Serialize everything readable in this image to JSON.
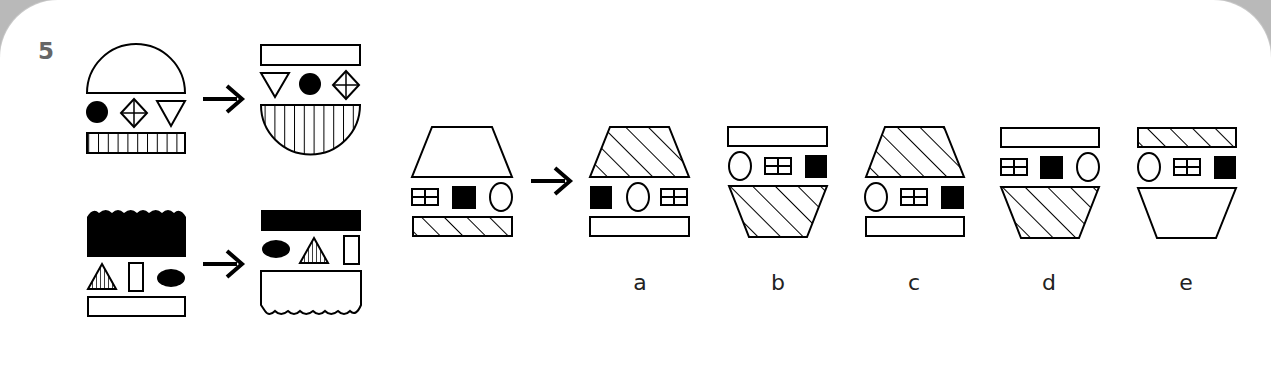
{
  "question": {
    "number": "5"
  },
  "examples": [
    {
      "before": [
        "semicircle (top, white)",
        "black circle",
        "diamond with cross",
        "down triangle",
        "vertical-striped bar"
      ],
      "after": [
        "white bar",
        "down triangle",
        "black circle",
        "diamond with cross",
        "vertical-striped inverted semicircle"
      ]
    },
    {
      "before": [
        "wavy-top black block",
        "striped triangle",
        "white tall rectangle",
        "black ellipse",
        "white bar"
      ],
      "after": [
        "black bar",
        "black ellipse",
        "striped triangle",
        "white tall rectangle",
        "wavy-bottom white block"
      ]
    }
  ],
  "test": {
    "figure": [
      "white trapezoid (top)",
      "window square",
      "black square",
      "oval",
      "diagonal-striped bar"
    ]
  },
  "options": [
    {
      "label": "a"
    },
    {
      "label": "b"
    },
    {
      "label": "c"
    },
    {
      "label": "d"
    },
    {
      "label": "e"
    }
  ],
  "colors": {
    "ink": "#000000",
    "background": "#ffffff",
    "number": "#666666"
  }
}
